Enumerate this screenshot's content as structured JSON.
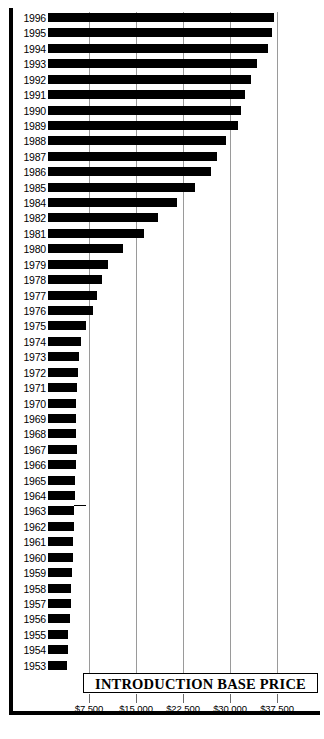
{
  "chart_data": {
    "type": "bar",
    "orientation": "horizontal",
    "title": "INTRODUCTION BASE PRICE",
    "xlabel": "",
    "ylabel": "",
    "xlim": [
      0,
      40000
    ],
    "grid": true,
    "legend": null,
    "xticks": [
      7500,
      15000,
      22500,
      30000,
      37500
    ],
    "xticklabels": [
      "$7,500",
      "$15,000",
      "$22,500",
      "$30,000",
      "$37,500"
    ],
    "categories": [
      "1996",
      "1995",
      "1994",
      "1993",
      "1992",
      "1991",
      "1990",
      "1989",
      "1988",
      "1987",
      "1986",
      "1985",
      "1984",
      "1982",
      "1981",
      "1980",
      "1979",
      "1978",
      "1977",
      "1976",
      "1975",
      "1974",
      "1973",
      "1972",
      "1971",
      "1970",
      "1969",
      "1968",
      "1967",
      "1966",
      "1965",
      "1964",
      "1963",
      "1962",
      "1961",
      "1960",
      "1959",
      "1958",
      "1957",
      "1956",
      "1955",
      "1954",
      "1953"
    ],
    "values": [
      37000,
      36700,
      36000,
      34300,
      33300,
      32400,
      31700,
      31200,
      29300,
      28000,
      26900,
      24400,
      21600,
      18500,
      16200,
      13000,
      10500,
      9600,
      8700,
      8100,
      7000,
      6200,
      5900,
      5800,
      5600,
      5500,
      5400,
      5450,
      5550,
      5400,
      5300,
      5200,
      5150,
      5100,
      5000,
      4900,
      4800,
      4700,
      4600,
      4400,
      4200,
      4100,
      4000
    ],
    "bar_color": "#000000",
    "gridline_color": "#9a9a9a",
    "background_color": "#ffffff"
  },
  "annotations": {
    "pointer_year": "1967"
  }
}
